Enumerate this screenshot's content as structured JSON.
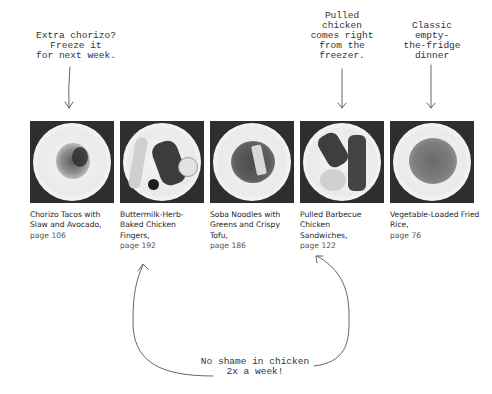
{
  "annotations": {
    "chorizo_note": "Extra chorizo?\nFreeze it\nfor next week.",
    "pulled_chicken_note": "Pulled\nchicken\ncomes right\nfrom the\nfreezer.",
    "fried_rice_note": "Classic\nempty-\nthe-fridge\ndinner",
    "chicken_note": "No shame in chicken\n2x a week!"
  },
  "recipes": [
    {
      "title": "Chorizo Tacos with Slaw and  Avocado,",
      "page": "page 106",
      "image": "chorizo-tacos-photo"
    },
    {
      "title": "Buttermilk-Herb-Baked Chicken Fingers,",
      "page": "page 192",
      "image": "chicken-fingers-photo"
    },
    {
      "title": "Soba Noodles with Greens and Crispy Tofu,",
      "page": "page 186",
      "image": "soba-noodles-photo"
    },
    {
      "title": "Pulled Barbecue Chicken Sandwiches,",
      "page": "page 122",
      "image": "bbq-chicken-photo"
    },
    {
      "title": "Vegetable-Loaded Fried Rice,",
      "page": "page 76",
      "image": "fried-rice-photo"
    }
  ],
  "colors": {
    "text": "#1e1e1e",
    "note_text": "#333333",
    "arrow": "#555555",
    "photo_bg": "#2e2e2e"
  }
}
